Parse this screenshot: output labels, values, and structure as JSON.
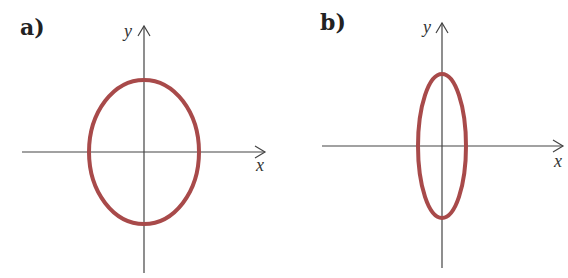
{
  "colors": {
    "curve": "#a84a4a",
    "axis": "#444444",
    "background": "#ffffff"
  },
  "panels": [
    {
      "label": "a)",
      "x_axis_label": "x",
      "y_axis_label": "y",
      "shape": "ellipse",
      "description": "vertical ellipse, moderately elongated along y",
      "center": [
        144,
        152
      ],
      "rx": 55,
      "ry": 72
    },
    {
      "label": "b)",
      "x_axis_label": "x",
      "y_axis_label": "y",
      "shape": "ellipse",
      "description": "narrow vertical ellipse, strongly elongated along y",
      "center": [
        442,
        146
      ],
      "rx": 24,
      "ry": 72
    }
  ]
}
